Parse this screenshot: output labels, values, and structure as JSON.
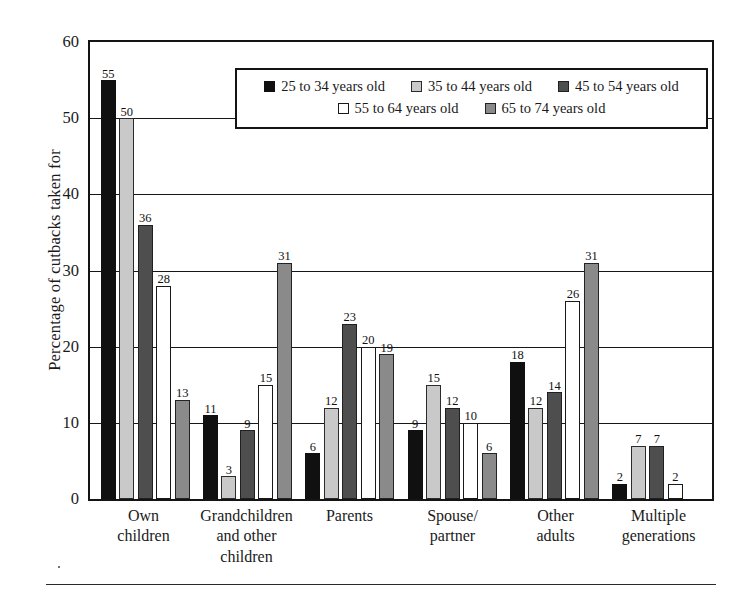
{
  "chart_data": {
    "type": "bar",
    "title": "",
    "xlabel": "",
    "ylabel": "Percentage of cutbacks taken for",
    "ylim": [
      0,
      60
    ],
    "yticks": [
      0,
      10,
      20,
      30,
      40,
      50,
      60
    ],
    "grid": true,
    "legend_position": "top-center-inside",
    "categories": [
      "Own\nchildren",
      "Grandchildren\nand other\nchildren",
      "Parents",
      "Spouse/\npartner",
      "Other\nadults",
      "Multiple\ngenerations"
    ],
    "series": [
      {
        "name": "25 to 34 years old",
        "color": "#101010",
        "values": [
          55,
          11,
          6,
          9,
          18,
          2
        ]
      },
      {
        "name": "35 to 44 years old",
        "color": "#c9c9c9",
        "values": [
          50,
          3,
          12,
          15,
          12,
          7
        ]
      },
      {
        "name": "45 to 54 years old",
        "color": "#4e4e4e",
        "values": [
          36,
          9,
          23,
          12,
          14,
          7
        ]
      },
      {
        "name": "55 to 64 years old",
        "color": "#ffffff",
        "values": [
          28,
          15,
          20,
          10,
          26,
          2
        ]
      },
      {
        "name": "65 to 74 years old",
        "color": "#8a8a8a",
        "values": [
          13,
          31,
          19,
          6,
          31,
          0
        ]
      }
    ]
  },
  "legend": {
    "row1": [
      {
        "label": "25 to 34 years old",
        "swatch": "legend-swatch-25-34"
      },
      {
        "label": "35 to 44 years old",
        "swatch": "legend-swatch-35-44"
      },
      {
        "label": "45 to 54 years old",
        "swatch": "legend-swatch-45-54"
      }
    ],
    "row2": [
      {
        "label": "55 to 64 years old",
        "swatch": "legend-swatch-55-64"
      },
      {
        "label": "65 to 74 years old",
        "swatch": "legend-swatch-65-74"
      }
    ]
  }
}
